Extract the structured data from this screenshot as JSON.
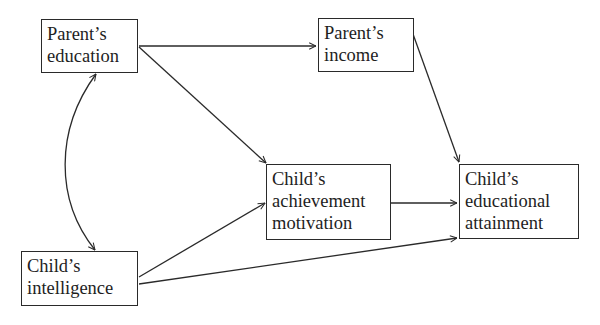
{
  "diagram": {
    "type": "path-diagram",
    "nodes": [
      {
        "id": "parents_education",
        "lines": [
          "Parent’s",
          "education"
        ]
      },
      {
        "id": "parents_income",
        "lines": [
          "Parent’s",
          "income"
        ]
      },
      {
        "id": "childs_achievement_motivation",
        "lines": [
          "Child’s",
          "achievement",
          "motivation"
        ]
      },
      {
        "id": "childs_educational_attainment",
        "lines": [
          "Child’s",
          "educational",
          "attainment"
        ]
      },
      {
        "id": "childs_intelligence",
        "lines": [
          "Child’s",
          "intelligence"
        ]
      }
    ],
    "edges": [
      {
        "from": "parents_education",
        "to": "parents_income",
        "type": "directed"
      },
      {
        "from": "parents_education",
        "to": "childs_achievement_motivation",
        "type": "directed"
      },
      {
        "from": "parents_education",
        "to": "childs_intelligence",
        "type": "bidirectional-curved"
      },
      {
        "from": "parents_income",
        "to": "childs_educational_attainment",
        "type": "directed"
      },
      {
        "from": "childs_intelligence",
        "to": "childs_achievement_motivation",
        "type": "directed"
      },
      {
        "from": "childs_intelligence",
        "to": "childs_educational_attainment",
        "type": "directed"
      },
      {
        "from": "childs_achievement_motivation",
        "to": "childs_educational_attainment",
        "type": "directed"
      }
    ],
    "colors": {
      "stroke": "#2a2a2a",
      "text": "#1e1e1e",
      "background": "#ffffff"
    }
  }
}
